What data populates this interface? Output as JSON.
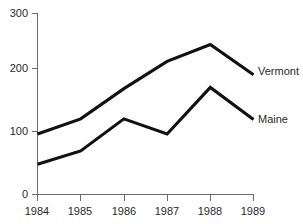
{
  "chart_data": {
    "type": "line",
    "title": "",
    "xlabel": "",
    "ylabel": "",
    "categories": [
      "1984",
      "1985",
      "1986",
      "1987",
      "1988",
      "1989"
    ],
    "x": [
      1984,
      1985,
      1986,
      1987,
      1988,
      1989
    ],
    "series": [
      {
        "name": "Vermont",
        "values": [
          100,
          125,
          175,
          220,
          248,
          198
        ],
        "color": "#111111"
      },
      {
        "name": "Maine",
        "values": [
          50,
          72,
          125,
          100,
          177,
          124
        ],
        "color": "#111111"
      }
    ],
    "ylim": [
      0,
      300
    ],
    "yticks": [
      0,
      100,
      200,
      300
    ],
    "ytick_labels": [
      "0",
      "100",
      "200",
      "300"
    ],
    "xtick_labels": [
      "1984",
      "1985",
      "1986",
      "1987",
      "1988",
      "1989"
    ],
    "grid": false,
    "legend_position": "inline-right",
    "legend_entries": [
      "Vermont",
      "Maine"
    ],
    "background_color": "#ffffff",
    "axis_color": "#6b6b6b"
  },
  "axis": {
    "y_ticks": [
      {
        "label": "300",
        "value": 300
      },
      {
        "label": "200",
        "value": 200
      },
      {
        "label": "100",
        "value": 100
      },
      {
        "label": "0",
        "value": 0
      }
    ],
    "x_ticks": [
      {
        "label": "1984"
      },
      {
        "label": "1985"
      },
      {
        "label": "1986"
      },
      {
        "label": "1987"
      },
      {
        "label": "1988"
      },
      {
        "label": "1989"
      }
    ]
  },
  "labels": {
    "vermont": "Vermont",
    "maine": "Maine"
  },
  "title_text": ""
}
